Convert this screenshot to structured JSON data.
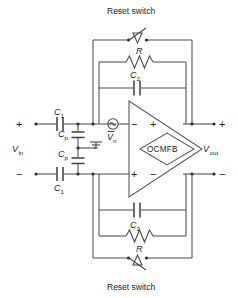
{
  "figure": {
    "type": "circuit-schematic",
    "colors": {
      "wire": "#4a4a4a",
      "text": "#1c1c1c",
      "background": "#ffffff"
    }
  },
  "labels": {
    "reset_switch_top": "Reset switch",
    "reset_switch_bottom": "Reset switch",
    "r_top": "R",
    "r_bottom": "R",
    "c2_top": "C",
    "c2_top_sub": "2",
    "c2_bottom": "C",
    "c2_bottom_sub": "2",
    "c1_top": "C",
    "c1_top_sub": "1",
    "c1_bottom": "C",
    "c1_bottom_sub": "1",
    "cp_top": "C",
    "cp_top_sub": "p",
    "cp_bottom": "C",
    "cp_bottom_sub": "p",
    "vn": "V",
    "vn_sub": "n",
    "vin": "V",
    "vin_sub": "in",
    "vout": "V",
    "vout_sub": "out",
    "ocmfb": "OCMFB",
    "in_plus": "+",
    "in_minus": "−",
    "opamp_in_minus": "−",
    "opamp_in_plus": "+",
    "opamp_out_plus": "+",
    "opamp_out_minus": "−",
    "out_plus": "+",
    "out_minus": "−"
  },
  "components": [
    {
      "name": "reset-switch-top",
      "type": "switch",
      "label": "Reset switch"
    },
    {
      "name": "resistor-top",
      "type": "resistor",
      "label": "R"
    },
    {
      "name": "capacitor-c2-top",
      "type": "capacitor",
      "label": "C2"
    },
    {
      "name": "capacitor-c1-top",
      "type": "capacitor",
      "label": "C1"
    },
    {
      "name": "capacitor-cp-top",
      "type": "capacitor",
      "label": "Cp"
    },
    {
      "name": "noise-source-vn",
      "type": "ac-source",
      "label": "Vn"
    },
    {
      "name": "ground",
      "type": "ground",
      "label": ""
    },
    {
      "name": "opamp",
      "type": "opamp",
      "label": ""
    },
    {
      "name": "ocmfb-block",
      "type": "diamond",
      "label": "OCMFB"
    },
    {
      "name": "capacitor-cp-bottom",
      "type": "capacitor",
      "label": "Cp"
    },
    {
      "name": "capacitor-c1-bottom",
      "type": "capacitor",
      "label": "C1"
    },
    {
      "name": "capacitor-c2-bottom",
      "type": "capacitor",
      "label": "C2"
    },
    {
      "name": "resistor-bottom",
      "type": "resistor",
      "label": "R"
    },
    {
      "name": "reset-switch-bottom",
      "type": "switch",
      "label": "Reset switch"
    }
  ]
}
